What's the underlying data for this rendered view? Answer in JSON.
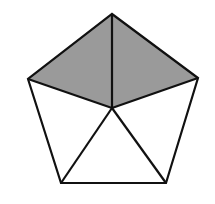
{
  "diagram": {
    "type": "pentagon-dissection",
    "stroke_color": "#111111",
    "shade_color": "#9a9a9a",
    "background": "#ffffff",
    "vertices": {
      "top": [
        112,
        14
      ],
      "left": [
        28,
        79
      ],
      "right": [
        198,
        78
      ],
      "bottom_left": [
        61,
        183
      ],
      "bottom_right": [
        166,
        183
      ],
      "center": [
        112,
        108
      ]
    },
    "shaded_triangles": [
      [
        "top",
        "left",
        "center"
      ],
      [
        "top",
        "right",
        "center"
      ]
    ],
    "segments": [
      [
        "center",
        "top"
      ],
      [
        "center",
        "left"
      ],
      [
        "center",
        "right"
      ],
      [
        "center",
        "bottom_left"
      ],
      [
        "center",
        "bottom_right"
      ]
    ]
  }
}
